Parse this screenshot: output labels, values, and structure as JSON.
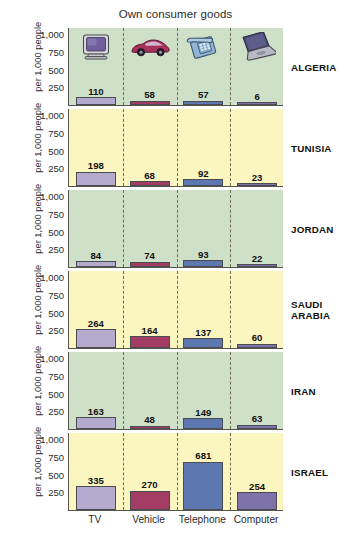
{
  "chart_data": {
    "type": "bar",
    "title": "Own consumer goods",
    "xlabel": "",
    "ylabel": "per 1,000 people",
    "ylim": [
      0,
      1100
    ],
    "yticks": [
      250,
      500,
      750,
      1000
    ],
    "ytick_labels": [
      "250",
      "500",
      "750",
      "1,000"
    ],
    "grid": false,
    "legend": "none",
    "layout": "small-multiples, one row per country, shared axes",
    "categories": [
      "TV",
      "Vehicle",
      "Telephone",
      "Computer"
    ],
    "category_icons": [
      "tv-icon",
      "car-icon",
      "telephone-icon",
      "laptop-icon"
    ],
    "series": [
      {
        "name": "ALGERIA",
        "values": [
          110,
          58,
          57,
          6
        ]
      },
      {
        "name": "TUNISIA",
        "values": [
          198,
          68,
          92,
          23
        ]
      },
      {
        "name": "JORDAN",
        "values": [
          84,
          74,
          93,
          22
        ]
      },
      {
        "name": "SAUDI ARABIA",
        "values": [
          264,
          164,
          137,
          60
        ]
      },
      {
        "name": "IRAN",
        "values": [
          163,
          48,
          149,
          63
        ]
      },
      {
        "name": "ISRAEL",
        "values": [
          335,
          270,
          681,
          254
        ]
      }
    ],
    "panel_backgrounds": [
      "#cfe0c9",
      "#fbf5c0",
      "#cfe0c9",
      "#fbf5c0",
      "#cfe0c9",
      "#fbf5c0"
    ],
    "bar_colors": [
      "#b3aace",
      "#a23c62",
      "#5d77b0",
      "#7d72a9"
    ],
    "axis_color": "#55554e",
    "divider_color": "#6d6d4e"
  },
  "panels": [
    {
      "country": "ALGERIA",
      "country_display": "ALGERIA",
      "bg": "#cfe0c9",
      "values": [
        110,
        58,
        57,
        6
      ],
      "labels": [
        "110",
        "58",
        "57",
        "6"
      ]
    },
    {
      "country": "TUNISIA",
      "country_display": "TUNISIA",
      "bg": "#fbf5c0",
      "values": [
        198,
        68,
        92,
        23
      ],
      "labels": [
        "198",
        "68",
        "92",
        "23"
      ]
    },
    {
      "country": "JORDAN",
      "country_display": "JORDAN",
      "bg": "#cfe0c9",
      "values": [
        84,
        74,
        93,
        22
      ],
      "labels": [
        "84",
        "74",
        "93",
        "22"
      ]
    },
    {
      "country": "SAUDI ARABIA",
      "country_display": "SAUDI\nARABIA",
      "bg": "#fbf5c0",
      "values": [
        264,
        164,
        137,
        60
      ],
      "labels": [
        "264",
        "164",
        "137",
        "60"
      ]
    },
    {
      "country": "IRAN",
      "country_display": "IRAN",
      "bg": "#cfe0c9",
      "values": [
        163,
        48,
        149,
        63
      ],
      "labels": [
        "163",
        "48",
        "149",
        "63"
      ]
    },
    {
      "country": "ISRAEL",
      "country_display": "ISRAEL",
      "bg": "#fbf5c0",
      "values": [
        335,
        270,
        681,
        254
      ],
      "labels": [
        "335",
        "270",
        "681",
        "254"
      ]
    }
  ],
  "axis": {
    "ylabel": "per 1,000 people",
    "ytick_labels": [
      "1,000",
      "750",
      "500",
      "250"
    ],
    "ytick_values": [
      1000,
      750,
      500,
      250
    ]
  },
  "xaxis": {
    "labels": [
      "TV",
      "Vehicle",
      "Telephone",
      "Computer"
    ]
  }
}
